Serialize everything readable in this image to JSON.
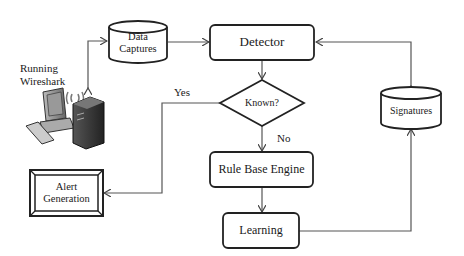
{
  "diagram": {
    "nodes": {
      "data_captures": {
        "label_line1": "Data",
        "label_line2": "Captures",
        "shape": "cylinder"
      },
      "detector": {
        "label": "Detector",
        "shape": "rounded-rect"
      },
      "known": {
        "label": "Known?",
        "shape": "diamond"
      },
      "signatures": {
        "label": "Signatures",
        "shape": "cylinder"
      },
      "rule_base_engine": {
        "label": "Rule Base Engine",
        "shape": "rounded-rect"
      },
      "learning": {
        "label": "Learning",
        "shape": "rounded-rect"
      },
      "alert_generation": {
        "label_line1": "Alert",
        "label_line2": "Generation",
        "shape": "double-bevel-rect"
      },
      "wireshark": {
        "label_line1": "Running",
        "label_line2": "Wireshark",
        "icon": "computer-workstation-icon"
      }
    },
    "edges": {
      "yes_label": "Yes",
      "no_label": "No"
    }
  }
}
